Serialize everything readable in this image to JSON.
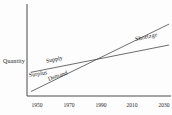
{
  "chart_data": {
    "type": "line",
    "title": "",
    "xlabel": "",
    "ylabel": "Quantity",
    "x_tick_labels": [
      "1950",
      "1970",
      "1990",
      "2010",
      "2030"
    ],
    "y_tick_labels": [],
    "grid": false,
    "legend_position": "none",
    "series": [
      {
        "name": "Supply",
        "points_rel": [
          [
            0.0,
            0.26
          ],
          [
            1.0,
            0.56
          ]
        ]
      },
      {
        "name": "Demand",
        "points_rel": [
          [
            0.0,
            0.05
          ],
          [
            1.0,
            0.79
          ]
        ]
      }
    ],
    "annotations": [
      "Surplus",
      "Shortage"
    ],
    "intersection": {
      "x_tick": "1990",
      "note_rel": [
        0.48,
        0.42
      ]
    }
  }
}
